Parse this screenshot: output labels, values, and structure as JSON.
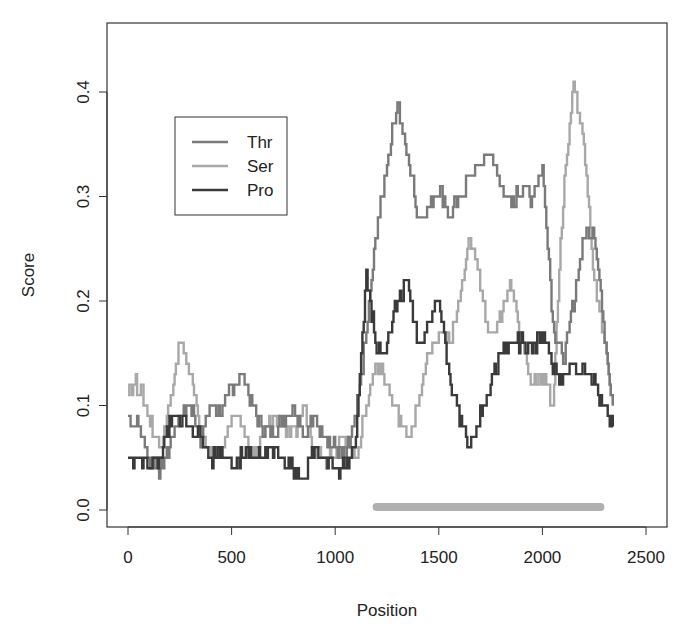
{
  "chart_data": {
    "type": "line",
    "title": "",
    "xlabel": "Position",
    "ylabel": "Score",
    "xlim": [
      0,
      2500
    ],
    "ylim": [
      0.0,
      0.4
    ],
    "x_ticks": [
      "0",
      "500",
      "1000",
      "1500",
      "2000",
      "2500"
    ],
    "y_ticks": [
      "0.0",
      "0.1",
      "0.2",
      "0.3",
      "0.4"
    ],
    "grid": false,
    "legend_position": "top-left (inside)",
    "x": [
      0,
      50,
      100,
      150,
      200,
      250,
      300,
      350,
      400,
      450,
      500,
      550,
      600,
      650,
      700,
      750,
      800,
      850,
      900,
      950,
      1000,
      1050,
      1100,
      1150,
      1200,
      1250,
      1300,
      1350,
      1400,
      1450,
      1500,
      1550,
      1600,
      1650,
      1700,
      1750,
      1800,
      1850,
      1900,
      1950,
      2000,
      2050,
      2100,
      2150,
      2200,
      2250,
      2300,
      2340
    ],
    "series": [
      {
        "name": "Thr",
        "color": "#7a7a7a",
        "values": [
          0.09,
          0.08,
          0.05,
          0.04,
          0.06,
          0.09,
          0.1,
          0.07,
          0.1,
          0.09,
          0.12,
          0.13,
          0.1,
          0.08,
          0.07,
          0.09,
          0.1,
          0.07,
          0.09,
          0.07,
          0.06,
          0.05,
          0.09,
          0.17,
          0.27,
          0.33,
          0.39,
          0.34,
          0.28,
          0.29,
          0.31,
          0.28,
          0.3,
          0.32,
          0.33,
          0.34,
          0.31,
          0.29,
          0.31,
          0.3,
          0.33,
          0.18,
          0.14,
          0.2,
          0.26,
          0.27,
          0.17,
          0.1
        ]
      },
      {
        "name": "Ser",
        "color": "#a8a8a8",
        "values": [
          0.12,
          0.12,
          0.09,
          0.06,
          0.1,
          0.16,
          0.13,
          0.08,
          0.05,
          0.06,
          0.09,
          0.08,
          0.05,
          0.07,
          0.09,
          0.08,
          0.07,
          0.1,
          0.06,
          0.05,
          0.06,
          0.07,
          0.05,
          0.1,
          0.14,
          0.12,
          0.09,
          0.07,
          0.1,
          0.15,
          0.17,
          0.16,
          0.2,
          0.26,
          0.22,
          0.16,
          0.19,
          0.22,
          0.16,
          0.12,
          0.13,
          0.1,
          0.3,
          0.41,
          0.35,
          0.22,
          0.16,
          0.1
        ]
      },
      {
        "name": "Pro",
        "color": "#3a3a3a",
        "values": [
          0.05,
          0.05,
          0.04,
          0.05,
          0.08,
          0.09,
          0.08,
          0.07,
          0.05,
          0.06,
          0.04,
          0.05,
          0.05,
          0.05,
          0.06,
          0.05,
          0.04,
          0.03,
          0.06,
          0.05,
          0.04,
          0.04,
          0.07,
          0.23,
          0.15,
          0.16,
          0.2,
          0.22,
          0.16,
          0.18,
          0.2,
          0.13,
          0.09,
          0.06,
          0.09,
          0.12,
          0.15,
          0.16,
          0.16,
          0.15,
          0.17,
          0.14,
          0.12,
          0.14,
          0.13,
          0.12,
          0.1,
          0.08
        ]
      }
    ],
    "annotations": [
      {
        "type": "bar",
        "label": "region",
        "x_start": 1200,
        "x_end": 2280,
        "y": 0.0,
        "color": "#b0b0b0"
      }
    ]
  },
  "legend": {
    "items": [
      {
        "label": "Thr",
        "color": "#7a7a7a"
      },
      {
        "label": "Ser",
        "color": "#a8a8a8"
      },
      {
        "label": "Pro",
        "color": "#3a3a3a"
      }
    ]
  },
  "axes": {
    "xlabel": "Position",
    "ylabel": "Score",
    "x_ticks": [
      {
        "label": "0",
        "value": 0
      },
      {
        "label": "500",
        "value": 500
      },
      {
        "label": "1000",
        "value": 1000
      },
      {
        "label": "1500",
        "value": 1500
      },
      {
        "label": "2000",
        "value": 2000
      },
      {
        "label": "2500",
        "value": 2500
      }
    ],
    "y_ticks": [
      {
        "label": "0.0",
        "value": 0.0
      },
      {
        "label": "0.1",
        "value": 0.1
      },
      {
        "label": "0.2",
        "value": 0.2
      },
      {
        "label": "0.3",
        "value": 0.3
      },
      {
        "label": "0.4",
        "value": 0.4
      }
    ]
  }
}
